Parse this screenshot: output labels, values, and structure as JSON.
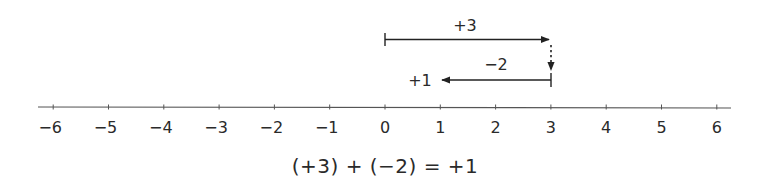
{
  "diagram": {
    "type": "number-line-addition",
    "colors": {
      "line": "#555555",
      "arrow": "#222222",
      "text": "#2a2a2a"
    },
    "number_line": {
      "min": -6,
      "max": 6,
      "tick_labels": [
        "−6",
        "−5",
        "−4",
        "−3",
        "−2",
        "−1",
        "0",
        "1",
        "2",
        "3",
        "4",
        "5",
        "6"
      ]
    },
    "arrows": [
      {
        "name": "first-addend",
        "from": 0,
        "to": 3,
        "label": "+3",
        "direction": "right"
      },
      {
        "name": "second-addend",
        "from": 3,
        "to": 1,
        "label": "−2",
        "direction": "left"
      }
    ],
    "connector": {
      "style": "dotted",
      "at": 3,
      "direction": "down"
    },
    "result_label": "+1",
    "equation": "(+3) + (−2) = +1"
  }
}
